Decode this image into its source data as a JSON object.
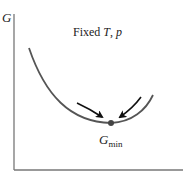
{
  "diagram": {
    "y_axis": {
      "label": "G"
    },
    "x_axis": {
      "label": ""
    },
    "condition": {
      "prefix": "Fixed ",
      "var1": "T",
      "sep": ", ",
      "var2": "p"
    },
    "minimum": {
      "symbol": "G",
      "subscript": "min"
    },
    "curve": {
      "shape": "convex-parabola",
      "color": "#555555"
    },
    "arrows": [
      {
        "direction": "down-right",
        "points_to": "minimum"
      },
      {
        "direction": "down-left",
        "points_to": "minimum"
      }
    ],
    "colors": {
      "axis": "#777777",
      "curve": "#555555",
      "arrow": "#111111",
      "point": "#444444"
    }
  }
}
